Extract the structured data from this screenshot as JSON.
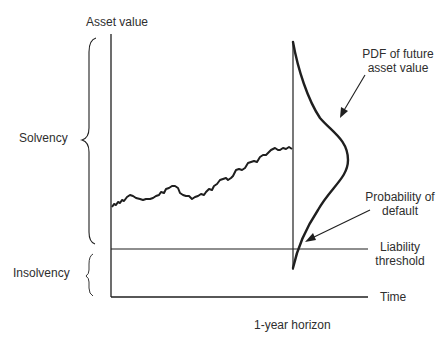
{
  "diagram": {
    "type": "structural model of default (Merton)",
    "labels": {
      "y_axis": "Asset value",
      "x_axis": "Time",
      "solvency": "Solvency",
      "insolvency": "Insolvency",
      "pdf_line1": "PDF of future",
      "pdf_line2": "asset value",
      "pd_line1": "Probability of",
      "pd_line2": "default",
      "liability_line1": "Liability",
      "liability_line2": "threshold",
      "horizon": "1-year horizon"
    },
    "colors": {
      "ink": "#1f1f1f",
      "text": "#2e2e2e",
      "background": "#ffffff"
    }
  }
}
